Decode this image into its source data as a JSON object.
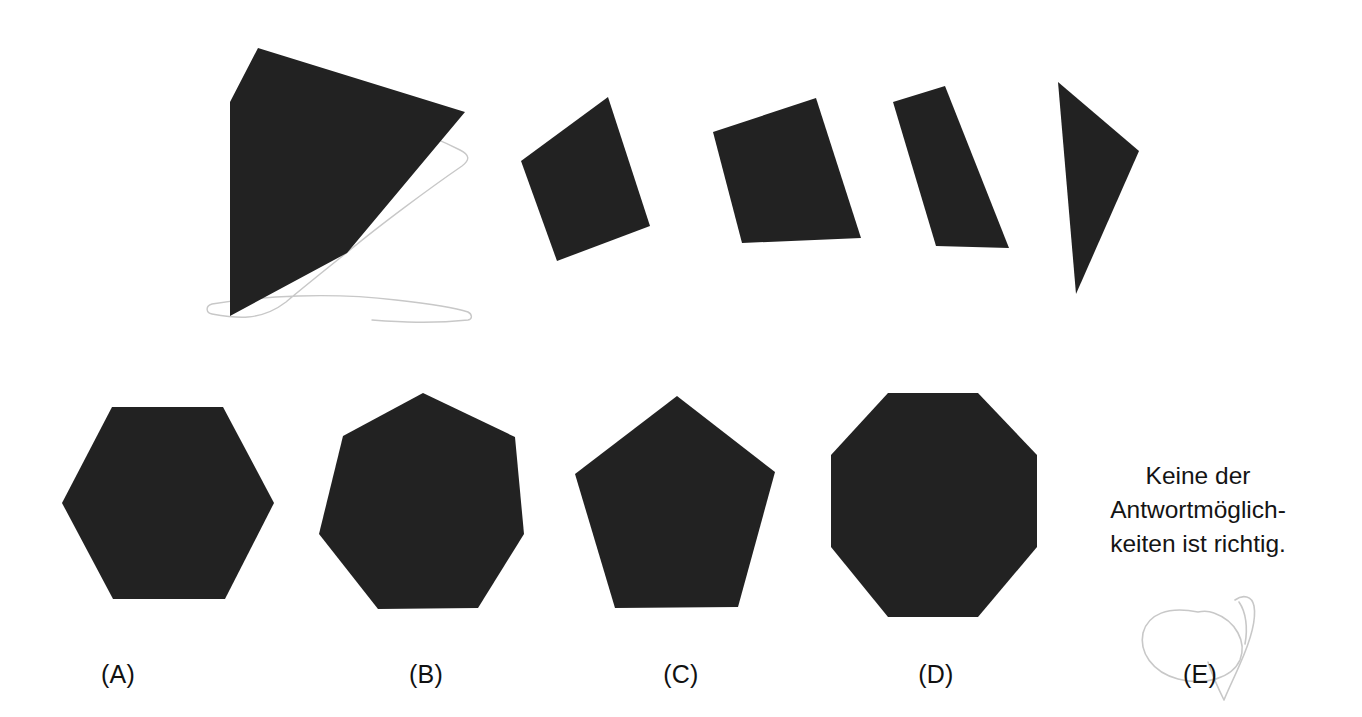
{
  "page": {
    "width": 1362,
    "height": 717,
    "background_color": "#ffffff",
    "ink_color": "#222222",
    "pencil_color": "#c8c8c8",
    "kind": "visual-reasoning-shape-assembly-question"
  },
  "prompt_row": {
    "name": "puzzle-pieces-row",
    "description": "One large notched polygon plus four smaller quadrilateral/triangular pieces",
    "pieces": [
      {
        "id": "piece-main-notched",
        "label": "main-notched-polygon",
        "sides": 6,
        "points": "258,48 465,112 347,253 322,198 347,253 230,316 230,102"
      },
      {
        "id": "piece-1",
        "label": "quadrilateral-1",
        "sides": 4,
        "points": "608,97 650,226 557,261 521,161"
      },
      {
        "id": "piece-2",
        "label": "quadrilateral-2",
        "sides": 4,
        "points": "816,98 861,238 742,243 713,132"
      },
      {
        "id": "piece-3",
        "label": "quadrilateral-3",
        "sides": 4,
        "points": "945,86 1009,248 936,246 893,102"
      },
      {
        "id": "piece-4",
        "label": "triangle-4",
        "sides": 3,
        "points": "1058,82 1139,151 1076,294"
      }
    ],
    "paper_outline": "M 347,125 C 400,120 432,136 460,150 C 470,155 470,160 462,166 C 430,188 380,225 350,250 C 330,266 300,290 286,302 C 260,322 235,318 212,314 C 206,313 205,306 212,304 C 262,296 330,292 396,300 C 432,304 456,308 468,312 C 472,314 473,319 468,320 C 430,324 400,322 372,320"
  },
  "answer_row": {
    "name": "answer-options-row",
    "options": [
      {
        "key": "A",
        "label": "(A)",
        "label_x": 118,
        "label_y": 660,
        "shape": "hexagon",
        "sides": 6,
        "points": "112,407 223,407 274,503 225,599 113,599 62,503"
      },
      {
        "key": "B",
        "label": "(B)",
        "label_x": 426,
        "label_y": 660,
        "shape": "heptagon",
        "sides": 7,
        "points": "423,393 515,437 524,534 478,608 378,609 319,534 343,436"
      },
      {
        "key": "C",
        "label": "(C)",
        "label_x": 681,
        "label_y": 660,
        "shape": "pentagon",
        "sides": 5,
        "points": "677,396 775,472 738,607 615,608 575,474"
      },
      {
        "key": "D",
        "label": "(D)",
        "label_x": 936,
        "label_y": 660,
        "shape": "octagon",
        "sides": 8,
        "points": "888,393 978,393 1037,455 1037,547 978,617 888,617 831,547 831,455"
      },
      {
        "key": "E",
        "label": "(E)",
        "label_x": 1200,
        "label_y": 660,
        "shape": "text",
        "text_lines": [
          "Keine der",
          "Antwortmöglich-",
          "keiten ist richtig."
        ]
      }
    ]
  },
  "annotations": {
    "name": "handwritten-pencil-marks",
    "marks": [
      {
        "id": "pencil-circle-around-e",
        "description": "faint pencil loop circling answer option E",
        "path": "M 1198,612 C 1168,606 1148,614 1143,633 C 1139,652 1152,672 1178,679 C 1205,686 1232,678 1240,660 C 1247,642 1236,621 1214,613 C 1209,611 1203,611 1198,612 Z"
      },
      {
        "id": "pencil-check-mark",
        "description": "faint pencil tick / flourish to the right of E",
        "path": "M 1235,600 C 1243,594 1252,596 1254,606 C 1257,622 1248,646 1240,664 C 1234,678 1228,690 1224,700 M 1224,700 C 1218,688 1212,674 1208,662 M 1239,602 C 1246,612 1248,628 1245,644"
      }
    ]
  }
}
